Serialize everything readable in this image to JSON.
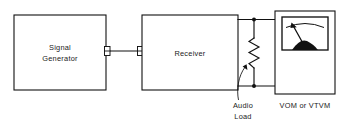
{
  "diagram": {
    "type": "block-diagram",
    "blocks": [
      {
        "id": "signal-generator",
        "label_line1": "Signal",
        "label_line2": "Generator",
        "x": 14,
        "y": 15,
        "width": 92,
        "height": 75
      },
      {
        "id": "receiver",
        "label_line1": "Receiver",
        "label_line2": "",
        "x": 142,
        "y": 15,
        "width": 96,
        "height": 75
      },
      {
        "id": "meter",
        "label_line1": "",
        "label_line2": "",
        "x": 275,
        "y": 11,
        "width": 60,
        "height": 83
      }
    ],
    "captions": {
      "audio_load_line1": "Audio",
      "audio_load_line2": "Load",
      "meter_label": "VOM or VTVM"
    },
    "components": {
      "resistor_name": "audio-load-resistor",
      "cable_name": "coaxial-cable",
      "connector_left_name": "coax-connector-left",
      "connector_right_name": "coax-connector-right",
      "meter_movement_name": "analog-meter-movement"
    },
    "colors": {
      "line": "#111111",
      "background": "#ffffff",
      "text": "#1a1a1a"
    }
  }
}
